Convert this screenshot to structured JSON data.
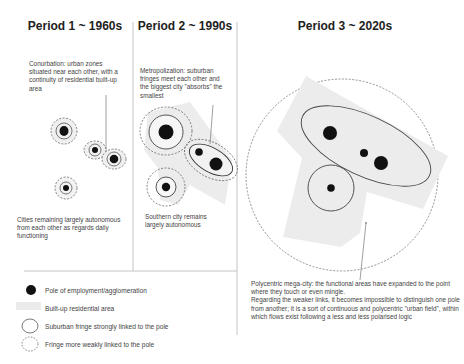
{
  "periods": [
    {
      "title": "Period 1 ~ 1960s",
      "caption_top": "Conurbation: urban zones situated near each other, with a continuity of residential built-up area",
      "caption_bottom": "Cities remaining largely autonomous from each other as regards daily functioning"
    },
    {
      "title": "Period 2 ~ 1990s",
      "caption_top": "Metropolization: suburban fringes meet each other and the biggest city \"absorbs\" the smallest",
      "caption_bottom": "Southern city remains largely autonomous"
    },
    {
      "title": "Period 3 ~ 2020s",
      "caption_bottom": "Polycentric mega-city: the functional areas have expanded to the point where they touch or even mingle.\nRegarding the weaker links, it becomes impossible to distinguish one pole from another; it is a sort of continuous and polycentric \"urban field\", within which flows exist following a less and less polarised logic"
    }
  ],
  "legend": [
    {
      "icon": "pole-dot-icon",
      "label": "Pole of employment/agglomeration"
    },
    {
      "icon": "built-up-area-swatch",
      "label": "Built-up residential area"
    },
    {
      "icon": "solid-circle-icon",
      "label": "Suburban  fringe strongly linked to the pole"
    },
    {
      "icon": "dashed-circle-icon",
      "label": "Fringe more  weakly linked to the pole"
    }
  ],
  "colors": {
    "pole": "#111111",
    "built_up": "#ebebeb",
    "line": "#555555",
    "divider": "#bbbbbb"
  }
}
